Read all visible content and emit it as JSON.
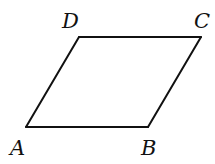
{
  "diagram": {
    "type": "parallelogram",
    "stroke_color": "#111111",
    "vertices": [
      {
        "id": "A",
        "label": "A",
        "x": 26,
        "y": 127,
        "label_x": 10,
        "label_y": 155
      },
      {
        "id": "B",
        "label": "B",
        "x": 148,
        "y": 127,
        "label_x": 141,
        "label_y": 155
      },
      {
        "id": "C",
        "label": "C",
        "x": 201,
        "y": 37,
        "label_x": 194,
        "label_y": 28
      },
      {
        "id": "D",
        "label": "D",
        "x": 79,
        "y": 37,
        "label_x": 62,
        "label_y": 28
      }
    ],
    "edges": [
      [
        "A",
        "B"
      ],
      [
        "B",
        "C"
      ],
      [
        "C",
        "D"
      ],
      [
        "D",
        "A"
      ]
    ]
  }
}
